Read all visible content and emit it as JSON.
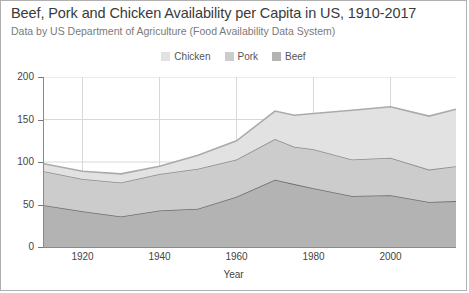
{
  "chart_data": {
    "type": "area",
    "title": "Beef, Pork and Chicken Availability per Capita in US, 1910-2017",
    "subtitle": "Data by US Department of Agriculture (Food Availability Data System)",
    "xlabel": "Year",
    "ylabel": "",
    "stacked": true,
    "grid": true,
    "legend_position": "top-center",
    "xlim": [
      1910,
      2017
    ],
    "ylim": [
      0,
      200
    ],
    "yticks": [
      0,
      50,
      100,
      150,
      200
    ],
    "xticks": [
      1920,
      1940,
      1960,
      1980,
      2000
    ],
    "x": [
      1910,
      1920,
      1930,
      1940,
      1950,
      1960,
      1970,
      1975,
      1980,
      1990,
      2000,
      2010,
      2017
    ],
    "series": [
      {
        "name": "Beef",
        "color": "#b3b3b3",
        "line_color": "#6e6e6e",
        "values": [
          49,
          42,
          36,
          43,
          45,
          59,
          79,
          74,
          69,
          60,
          61,
          53,
          54
        ]
      },
      {
        "name": "Pork",
        "color": "#cccccc",
        "line_color": "#8c8c8c",
        "values": [
          40,
          38,
          40,
          43,
          47,
          44,
          48,
          44,
          46,
          43,
          44,
          38,
          41
        ]
      },
      {
        "name": "Chicken",
        "color": "#e2e2e2",
        "line_color": "#aaaaaa",
        "values": [
          9,
          9,
          10,
          9,
          16,
          22,
          33,
          37,
          42,
          58,
          60,
          63,
          67
        ]
      }
    ],
    "legend": [
      {
        "label": "Chicken",
        "color": "#e2e2e2"
      },
      {
        "label": "Pork",
        "color": "#cccccc"
      },
      {
        "label": "Beef",
        "color": "#b3b3b3"
      }
    ]
  }
}
